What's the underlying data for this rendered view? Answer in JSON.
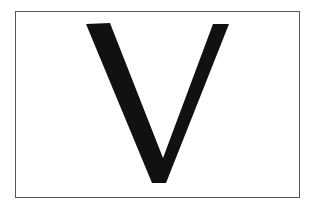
{
  "card": {
    "letter": "V",
    "border_color": "#555555",
    "glyph_color": "#111111",
    "background_color": "#ffffff"
  }
}
